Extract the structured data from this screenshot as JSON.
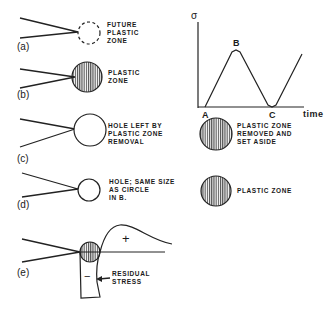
{
  "panels": [
    {
      "id": "a",
      "label": "(a)",
      "caption": "FUTURE PLASTIC ZONE",
      "caption_lines": [
        "FUTURE",
        "PLASTIC",
        "ZONE"
      ]
    },
    {
      "id": "b",
      "label": "(b)",
      "caption": "PLASTIC ZONE",
      "caption_lines": [
        "PLASTIC",
        "ZONE"
      ]
    },
    {
      "id": "c",
      "label": "(c)",
      "caption_lines": [
        "HOLE LEFT BY",
        "PLASTIC ZONE",
        "REMOVAL"
      ],
      "side_caption_lines": [
        "PLASTIC ZONE",
        "REMOVED AND",
        "SET ASIDE"
      ]
    },
    {
      "id": "d",
      "label": "(d)",
      "caption_lines": [
        "HOLE; SAME SIZE",
        "AS CIRCLE",
        "IN B."
      ],
      "side_caption_lines": [
        "PLASTIC ZONE"
      ]
    },
    {
      "id": "e",
      "label": "(e)",
      "plus": "+",
      "minus": "−",
      "caption_lines": [
        "RESIDUAL",
        "STRESS"
      ]
    }
  ],
  "graph": {
    "ylabel": "σ",
    "xlabel": "time",
    "points": [
      {
        "name": "A"
      },
      {
        "name": "B"
      },
      {
        "name": "C"
      }
    ]
  }
}
